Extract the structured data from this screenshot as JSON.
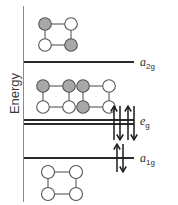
{
  "figure": {
    "type": "molecular-orbital-energy-level-diagram",
    "axis": {
      "label": "Energy",
      "orientation": "vertical",
      "direction": "increasing-upward",
      "ticks": []
    },
    "levels": [
      {
        "id": "a2g",
        "label_italic": "a",
        "label_sub": "2g",
        "label_text": "a2g",
        "degeneracy": 1,
        "line_count": 1,
        "electrons": 0,
        "y_px": 61
      },
      {
        "id": "eg",
        "label_italic": "e",
        "label_sub": "g",
        "label_text": "eg",
        "degeneracy": 2,
        "line_count": 2,
        "electrons": 4,
        "y_px": 121
      },
      {
        "id": "a1g",
        "label_italic": "a",
        "label_sub": "1g",
        "label_text": "a1g",
        "degeneracy": 1,
        "line_count": 1,
        "electrons": 2,
        "y_px": 157
      }
    ],
    "arrow_sets": [
      {
        "level": "eg",
        "pairs": 2,
        "spins": [
          "up",
          "down",
          "up",
          "down"
        ]
      },
      {
        "level": "a1g",
        "pairs": 1,
        "spins": [
          "up",
          "down"
        ]
      }
    ],
    "clusters": [
      {
        "id": "cluster-a2g",
        "associated_level": "a2g",
        "shape": "square-tetramer",
        "nodes": [
          {
            "position": "top-left",
            "fill": "shaded"
          },
          {
            "position": "top-right",
            "fill": "open"
          },
          {
            "position": "bottom-left",
            "fill": "open"
          },
          {
            "position": "bottom-right",
            "fill": "shaded"
          }
        ]
      },
      {
        "id": "cluster-eg-1",
        "associated_level": "eg",
        "shape": "square-tetramer",
        "nodes": [
          {
            "position": "top-left",
            "fill": "shaded"
          },
          {
            "position": "top-right",
            "fill": "shaded"
          },
          {
            "position": "bottom-left",
            "fill": "open"
          },
          {
            "position": "bottom-right",
            "fill": "open"
          }
        ]
      },
      {
        "id": "cluster-eg-2",
        "associated_level": "eg",
        "shape": "square-tetramer",
        "nodes": [
          {
            "position": "top-left",
            "fill": "shaded"
          },
          {
            "position": "top-right",
            "fill": "open"
          },
          {
            "position": "bottom-left",
            "fill": "shaded"
          },
          {
            "position": "bottom-right",
            "fill": "open"
          }
        ]
      },
      {
        "id": "cluster-a1g",
        "associated_level": "a1g",
        "shape": "square-tetramer",
        "nodes": [
          {
            "position": "top-left",
            "fill": "open"
          },
          {
            "position": "top-right",
            "fill": "open"
          },
          {
            "position": "bottom-left",
            "fill": "open"
          },
          {
            "position": "bottom-right",
            "fill": "open"
          }
        ]
      }
    ],
    "colors": {
      "background": "#ffffff",
      "axis": "#8a8a8a",
      "level_line": "#2b2b2b",
      "text": "#2b2b2b",
      "node_shaded_fill": "#a8a8a8",
      "node_open_fill": "#ffffff",
      "node_stroke": "#555555",
      "bond_stroke": "#666666",
      "arrow_stroke": "#1a1a1a"
    }
  }
}
